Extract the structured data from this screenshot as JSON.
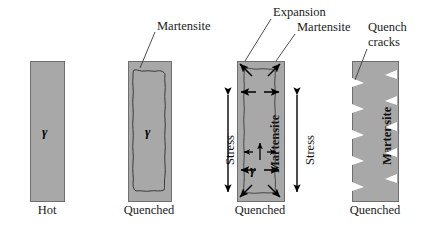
{
  "figure": {
    "colors": {
      "specimen_gray": "#a8a8a8",
      "outline": "#4a4a4a",
      "text": "#1a1a1a",
      "crack_white": "#ffffff"
    }
  },
  "stages": [
    {
      "id": "stage-hot",
      "caption": "Hot",
      "phase_symbol": "γ",
      "labels": []
    },
    {
      "id": "stage-quenched-shell",
      "caption": "Quenched",
      "phase_symbol": "γ",
      "labels": [
        "Martensite"
      ]
    },
    {
      "id": "stage-quenched-stress",
      "caption": "Quenched",
      "phase_symbol": "γ",
      "labels": [
        "Expansion",
        "Martensite"
      ],
      "interior_label": "Martensite",
      "stress_left": "Stress",
      "stress_right": "Stress"
    },
    {
      "id": "stage-quenched-cracks",
      "caption": "Quenched",
      "labels": [
        "Quench",
        "cracks"
      ],
      "interior_label": "Martensite"
    }
  ],
  "callouts": {
    "martensite": "Martensite",
    "expansion": "Expansion",
    "expansion_martensite": "Martensite",
    "quench_line1": "Quench",
    "quench_line2": "cracks"
  },
  "captions": {
    "hot": "Hot",
    "quenched_2": "Quenched",
    "quenched_3": "Quenched",
    "quenched_4": "Quenched"
  },
  "stress": {
    "left": "Stress",
    "right": "Stress"
  },
  "interior": {
    "martensite_3": "Martensite",
    "martensite_4": "Martensite",
    "gamma_1": "γ",
    "gamma_2": "γ",
    "gamma_3": "γ"
  }
}
